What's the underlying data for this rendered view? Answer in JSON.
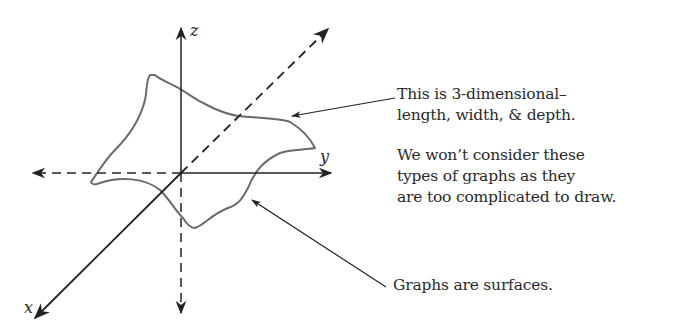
{
  "diagram": {
    "axes": {
      "x_label": "x",
      "y_label": "y",
      "z_label": "z"
    },
    "colors": {
      "ink": "#222222",
      "surface": "#6a6a6a",
      "background": "#ffffff"
    }
  },
  "annotations": {
    "three_d": {
      "lines": [
        "This is 3-dimensional–",
        "length, width, & depth."
      ]
    },
    "complicated": {
      "lines": [
        "We won’t consider these",
        "types of graphs as they",
        "are too complicated to draw."
      ]
    },
    "surfaces": {
      "lines": [
        "Graphs are surfaces."
      ]
    }
  }
}
